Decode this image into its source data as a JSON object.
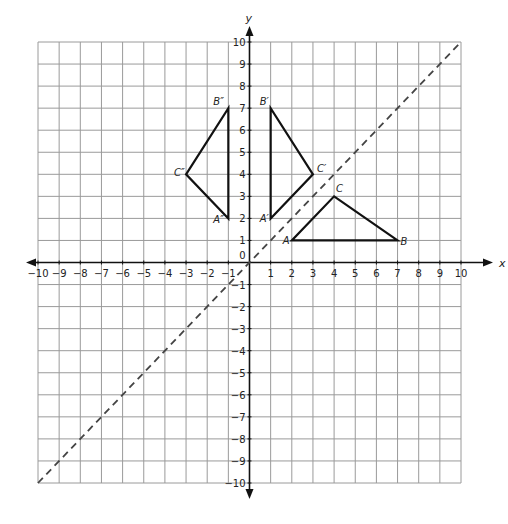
{
  "diagram": {
    "type": "coordinate-plane",
    "x_axis": {
      "label": "x",
      "min": -10,
      "max": 10,
      "ticks": [
        -10,
        -9,
        -8,
        -7,
        -6,
        -5,
        -4,
        -3,
        -2,
        -1,
        1,
        2,
        3,
        4,
        5,
        6,
        7,
        8,
        9,
        10
      ]
    },
    "y_axis": {
      "label": "y",
      "min": -10,
      "max": 10,
      "ticks": [
        -10,
        -9,
        -8,
        -7,
        -6,
        -5,
        -4,
        -3,
        -2,
        -1,
        1,
        2,
        3,
        4,
        5,
        6,
        7,
        8,
        9,
        10
      ]
    },
    "origin_label": "0",
    "reflection_line": {
      "equation": "y = x",
      "style": "dashed",
      "from": [
        -10,
        -10
      ],
      "to": [
        10,
        10
      ]
    },
    "triangles": [
      {
        "name": "ABC",
        "vertices": [
          {
            "label": "A",
            "x": 2,
            "y": 1
          },
          {
            "label": "B",
            "x": 7,
            "y": 1
          },
          {
            "label": "C",
            "x": 4,
            "y": 3
          }
        ]
      },
      {
        "name": "A'B'C'",
        "vertices": [
          {
            "label": "A′",
            "x": 1,
            "y": 2
          },
          {
            "label": "B′",
            "x": 1,
            "y": 7
          },
          {
            "label": "C′",
            "x": 3,
            "y": 4
          }
        ]
      },
      {
        "name": "A\"B\"C\"",
        "vertices": [
          {
            "label": "A″",
            "x": -1,
            "y": 2
          },
          {
            "label": "B″",
            "x": -1,
            "y": 7
          },
          {
            "label": "C″",
            "x": -3,
            "y": 4
          }
        ]
      }
    ],
    "colors": {
      "grid": "#9a9a9a",
      "axis": "#111111",
      "shape": "#111111",
      "dashed": "#444444"
    }
  }
}
